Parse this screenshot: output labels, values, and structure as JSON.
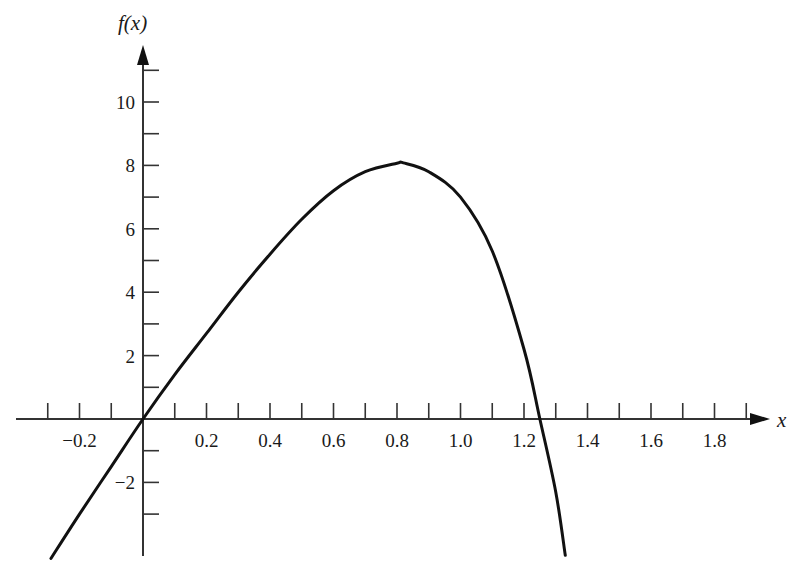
{
  "chart_data": {
    "type": "line",
    "title": "",
    "xlabel": "x",
    "ylabel": "f(x)",
    "xlim": [
      -0.3,
      1.9
    ],
    "ylim": [
      -4.4,
      11
    ],
    "grid": false,
    "legend": null,
    "x_ticks": [
      -0.2,
      0.2,
      0.4,
      0.6,
      0.8,
      1.0,
      1.2,
      1.4,
      1.6,
      1.8
    ],
    "x_tick_labels": [
      "−0.2",
      "0.2",
      "0.4",
      "0.6",
      "0.8",
      "1.0",
      "1.2",
      "1.4",
      "1.6",
      "1.8"
    ],
    "x_minor_ticks": [
      -0.3,
      -0.2,
      -0.1,
      0.1,
      0.2,
      0.3,
      0.4,
      0.5,
      0.6,
      0.7,
      0.8,
      0.9,
      1.0,
      1.1,
      1.2,
      1.3,
      1.4,
      1.5,
      1.6,
      1.7,
      1.8,
      1.9
    ],
    "y_ticks": [
      -2,
      2,
      4,
      6,
      8,
      10
    ],
    "y_tick_labels": [
      "−2",
      "2",
      "4",
      "6",
      "8",
      "10"
    ],
    "y_minor_ticks": [
      -3,
      -2,
      -1,
      1,
      2,
      3,
      4,
      5,
      6,
      7,
      8,
      9,
      10,
      11
    ],
    "series": [
      {
        "name": "f(x)",
        "x": [
          -0.29,
          -0.2,
          -0.1,
          0.0,
          0.1,
          0.2,
          0.3,
          0.4,
          0.5,
          0.6,
          0.7,
          0.8,
          0.82,
          0.9,
          1.0,
          1.1,
          1.2,
          1.25,
          1.3,
          1.33
        ],
        "y": [
          -4.4,
          -3.0,
          -1.5,
          0.0,
          1.4,
          2.7,
          4.0,
          5.2,
          6.3,
          7.2,
          7.8,
          8.07,
          8.08,
          7.8,
          7.0,
          5.3,
          2.2,
          0.0,
          -2.3,
          -4.3
        ]
      }
    ]
  }
}
